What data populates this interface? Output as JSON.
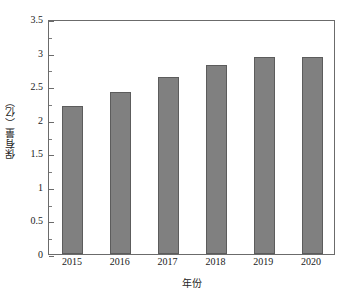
{
  "chart_data": {
    "type": "bar",
    "title": "",
    "subtitle": "",
    "xlabel": "年份",
    "ylabel": "保有量（亿）",
    "categories": [
      "2015",
      "2016",
      "2017",
      "2018",
      "2019",
      "2020"
    ],
    "values": [
      2.2,
      2.42,
      2.63,
      2.81,
      2.93,
      2.93
    ],
    "series": [
      {
        "name": "保有量",
        "values": [
          2.2,
          2.42,
          2.63,
          2.81,
          2.93,
          2.93
        ]
      }
    ],
    "ylim": [
      0,
      3.5
    ],
    "ytick_labels": [
      "0",
      "0.5",
      "1",
      "1.5",
      "2",
      "2.5",
      "3",
      "3.5"
    ],
    "ytick_values": [
      0,
      0.5,
      1,
      1.5,
      2,
      2.5,
      3,
      3.5
    ],
    "yminor_tick_values": [
      0.25,
      0.75,
      1.25,
      1.75,
      2.25,
      2.75,
      3.25
    ],
    "xtick_labels": [
      "2015",
      "2016",
      "2017",
      "2018",
      "2019",
      "2020"
    ],
    "grid": false,
    "legend": null,
    "legend_position": "none",
    "annotations": [],
    "colors": {
      "bar_fill": "#808080",
      "bar_edge": "#5c5c5c",
      "axis": "#6b6b6b",
      "text": "#1a1a1a",
      "background": "#ffffff"
    }
  }
}
